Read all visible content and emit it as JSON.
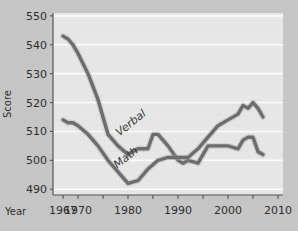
{
  "figure": {
    "background_color": "#c8c8c8",
    "plot_background_color": "#e9e9e9",
    "gridline_color": "#ffffff",
    "axis_color": "#555555",
    "series_color": "#6e6e6e"
  },
  "chart_data": {
    "type": "line",
    "title": "",
    "xlabel": "Year",
    "ylabel": "Score",
    "xlim": [
      1965,
      2011
    ],
    "ylim": [
      488,
      551
    ],
    "grid": true,
    "legend": "inline-labels",
    "x_ticks": [
      1967,
      1970,
      1975,
      1980,
      1985,
      1990,
      1995,
      2000,
      2005,
      2010
    ],
    "x_tick_labels": [
      "1967",
      "1970",
      "",
      "1980",
      "",
      "1990",
      "",
      "2000",
      "",
      "2010"
    ],
    "y_ticks": [
      490,
      500,
      510,
      520,
      530,
      540,
      550
    ],
    "y_tick_labels": [
      "490",
      "500",
      "510",
      "520",
      "530",
      "540",
      "550"
    ],
    "series": [
      {
        "name": "Verbal",
        "label": "Verbal",
        "label_rotation": -38,
        "x": [
          1967,
          1968,
          1969,
          1970,
          1972,
          1974,
          1976,
          1978,
          1980,
          1982,
          1984,
          1985,
          1986,
          1988,
          1990,
          1991,
          1992,
          1994,
          1996,
          1998,
          2000,
          2002,
          2003,
          2004,
          2005,
          2006,
          2007
        ],
        "y": [
          543,
          542,
          540,
          537,
          530,
          521,
          509,
          505,
          502,
          504,
          504,
          509,
          509,
          505,
          500,
          499,
          500,
          499,
          505,
          505,
          505,
          504,
          507,
          508,
          508,
          503,
          502
        ]
      },
      {
        "name": "Math",
        "label": "Math",
        "label_rotation": -38,
        "x": [
          1967,
          1968,
          1969,
          1970,
          1972,
          1974,
          1976,
          1978,
          1980,
          1982,
          1984,
          1986,
          1988,
          1990,
          1992,
          1994,
          1996,
          1998,
          2000,
          2002,
          2003,
          2004,
          2005,
          2006,
          2007
        ],
        "y": [
          514,
          513,
          513,
          512,
          509,
          505,
          500,
          496,
          492,
          493,
          497,
          500,
          501,
          501,
          501,
          504,
          508,
          512,
          514,
          516,
          519,
          518,
          520,
          518,
          515
        ]
      }
    ],
    "annotations": [
      {
        "text": "Verbal",
        "x": 1981,
        "y": 512
      },
      {
        "text": "Math",
        "x": 1980,
        "y": 500
      }
    ]
  }
}
